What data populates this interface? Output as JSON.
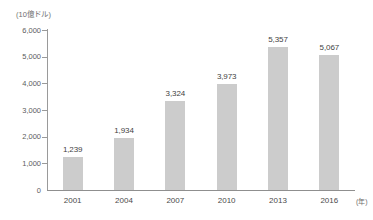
{
  "chart_data": {
    "type": "bar",
    "title": "",
    "subtitle": "",
    "xlabel": "(年)",
    "ylabel": "(10億ドル)",
    "categories": [
      "2001",
      "2004",
      "2007",
      "2010",
      "2013",
      "2016"
    ],
    "values": [
      1239,
      1934,
      3324,
      3973,
      5357,
      5067
    ],
    "value_labels": [
      "1,239",
      "1,934",
      "3,324",
      "3,973",
      "5,357",
      "5,067"
    ],
    "ylim": [
      0,
      6000
    ],
    "ytick_values": [
      0,
      1000,
      2000,
      3000,
      4000,
      5000,
      6000
    ],
    "ytick_labels": [
      "0",
      "1,000",
      "2,000",
      "3,000",
      "4,000",
      "5,000",
      "6,000"
    ],
    "grid": false,
    "legend": null,
    "legend_position": "none",
    "series": [
      {
        "name": "",
        "values": [
          1239,
          1934,
          3324,
          3973,
          5357,
          5067
        ]
      }
    ],
    "colors": {
      "bar_fill": "#cccccc",
      "axis": "#9a9a9a",
      "label_text": "#3f3f3f",
      "tick_text": "#5c5c5c",
      "background": "#ffffff"
    }
  }
}
